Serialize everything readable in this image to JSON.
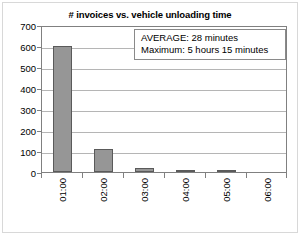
{
  "chart_data": {
    "type": "bar",
    "title": "# invoices vs. vehicle unloading time",
    "xlabel": "",
    "ylabel": "",
    "categories": [
      "01:00",
      "02:00",
      "03:00",
      "04:00",
      "05:00",
      "06:00"
    ],
    "values": [
      600,
      108,
      18,
      5,
      5,
      0
    ],
    "series": [
      {
        "name": "# invoices",
        "values": [
          600,
          108,
          18,
          5,
          5,
          0
        ]
      }
    ],
    "ylim": [
      0,
      700
    ],
    "ytick_labels": [
      "0",
      "100",
      "200",
      "300",
      "400",
      "500",
      "600",
      "700"
    ],
    "ytick_values": [
      0,
      100,
      200,
      300,
      400,
      500,
      600,
      700
    ],
    "grid": "horizontal",
    "legend": "none",
    "bar_color": "#969696",
    "bar_border_color": "#5a5a5a",
    "gridline_color": "#b5b5b5",
    "axis_color": "#808080",
    "annotations": [
      "AVERAGE: 28 minutes",
      "Maximum: 5 hours 15 minutes"
    ]
  },
  "annotation": {
    "average_label": "AVERAGE: 28 minutes",
    "maximum_label": "Maximum: 5 hours 15 minutes"
  }
}
